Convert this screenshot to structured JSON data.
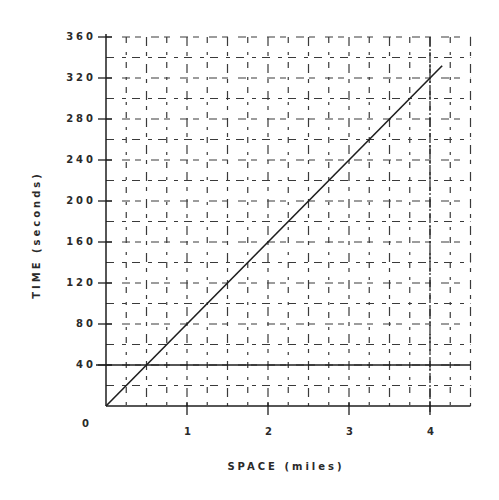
{
  "chart_data": {
    "type": "line",
    "title": "",
    "xlabel": "SPACE (miles)",
    "ylabel": "TIME (seconds)",
    "xlim": [
      0,
      4.5
    ],
    "ylim": [
      0,
      360
    ],
    "grid": true,
    "grid_style": "broken-dashed",
    "x_ticks": [
      {
        "value": 1,
        "label": "1"
      },
      {
        "value": 2,
        "label": "2"
      },
      {
        "value": 3,
        "label": "3"
      },
      {
        "value": 4,
        "label": "4"
      }
    ],
    "y_ticks": [
      {
        "value": 0,
        "label": "0"
      },
      {
        "value": 40,
        "label": "40"
      },
      {
        "value": 80,
        "label": "80"
      },
      {
        "value": 120,
        "label": "120"
      },
      {
        "value": 160,
        "label": "160"
      },
      {
        "value": 200,
        "label": "200"
      },
      {
        "value": 240,
        "label": "240"
      },
      {
        "value": 280,
        "label": "280"
      },
      {
        "value": 320,
        "label": "320"
      },
      {
        "value": 360,
        "label": "360"
      }
    ],
    "series": [
      {
        "name": "time-space line",
        "x": [
          0,
          4.15
        ],
        "y": [
          0,
          332
        ]
      }
    ],
    "reference_lines": [
      {
        "orientation": "horizontal",
        "value": 40
      },
      {
        "orientation": "vertical",
        "value": 4
      }
    ],
    "colors": {
      "ink": "#1e1e1e",
      "grid": "#3a3a3a"
    }
  }
}
